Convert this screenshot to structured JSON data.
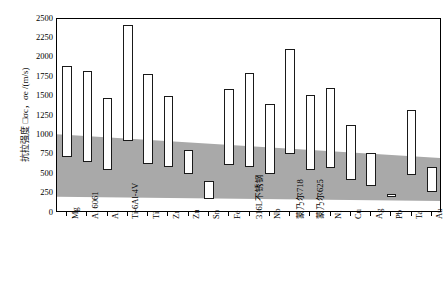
{
  "chart_data": {
    "type": "bar",
    "title": "",
    "subtitle": "",
    "xlabel": "",
    "ylabel": "抗拉强度 □σc，σe /(m/s)",
    "ylim": [
      0,
      2500
    ],
    "ytick_step": 250,
    "yticks": [
      "2500",
      "2250",
      "2000",
      "1750",
      "1500",
      "1250",
      "1000",
      "750",
      "500",
      "250",
      "0"
    ],
    "grid": false,
    "legend": "none",
    "bar_style": "floating-range",
    "categories": [
      "Mg",
      "Al 6061",
      "Al",
      "Ti-6Al-4V",
      "Ti",
      "Zr",
      "Zn",
      "Sn",
      "Fe",
      "316L不锈钢",
      "Nb",
      "蒙乃尔718",
      "蒙乃尔625",
      "Ni",
      "Cu",
      "Ag",
      "Pb",
      "Ta",
      "Au"
    ],
    "series": [
      {
        "name": "低值 (下限)",
        "values": [
          720,
          660,
          560,
          930,
          630,
          590,
          500,
          180,
          620,
          590,
          500,
          760,
          560,
          580,
          420,
          350,
          200,
          490,
          270
        ]
      },
      {
        "name": "高值 (上限)",
        "values": [
          1900,
          1830,
          1480,
          2420,
          1790,
          1510,
          810,
          410,
          1600,
          1810,
          1400,
          2110,
          1520,
          1610,
          1140,
          770,
          250,
          1330,
          590
        ]
      }
    ],
    "band": {
      "label": "窗口带 (灰色区域)",
      "color": "#a9a9a9",
      "left_upper": 1000,
      "right_upper": 690,
      "left_lower": 185,
      "right_lower": 130
    }
  },
  "axis": {
    "y_unit": "m/s"
  }
}
